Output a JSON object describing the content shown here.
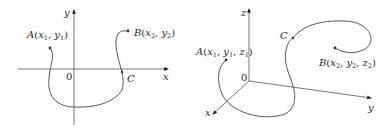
{
  "figures": [
    {
      "id": "2d",
      "axes": {
        "x_label": "x",
        "y_label": "y",
        "origin_label": "0"
      },
      "points": {
        "A": {
          "name": "A",
          "coords": [
            "x",
            "1",
            "y",
            "1"
          ]
        },
        "B": {
          "name": "B",
          "coords": [
            "x",
            "2",
            "y",
            "2"
          ]
        },
        "C": {
          "name": "C"
        }
      },
      "curve_color": "#444444"
    },
    {
      "id": "3d",
      "axes": {
        "x_label": "x",
        "y_label": "y",
        "z_label": "z",
        "origin_label": "0"
      },
      "points": {
        "A": {
          "name": "A",
          "coords": [
            "x",
            "1",
            "y",
            "1",
            "z",
            "1"
          ]
        },
        "B": {
          "name": "B",
          "coords": [
            "x",
            "2",
            "y",
            "2",
            "z",
            "2"
          ]
        },
        "C": {
          "name": "C"
        }
      },
      "curve_color": "#444444"
    }
  ]
}
